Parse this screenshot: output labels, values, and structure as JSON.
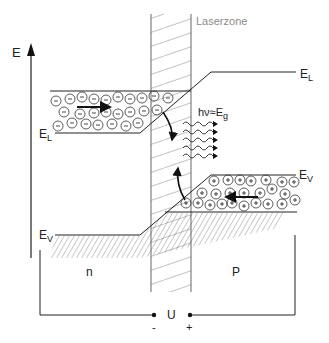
{
  "diagram": {
    "title": "",
    "axis_label": "E",
    "zone_label": "Laserzone",
    "conduction_band_label_left": {
      "main": "E",
      "sub": "L"
    },
    "conduction_band_label_right": {
      "main": "E",
      "sub": "L"
    },
    "valence_band_label_left": {
      "main": "E",
      "sub": "V"
    },
    "valence_band_label_right": {
      "main": "E",
      "sub": "V"
    },
    "photon_label": {
      "main": "hν≈E",
      "sub": "g"
    },
    "region_n_label": "n",
    "region_p_label": "P",
    "voltage_label": "U",
    "minus_terminal": "-",
    "plus_terminal": "+",
    "electron_symbol": "-",
    "hole_symbol": "+",
    "colors": {
      "line": "#222222",
      "hatch": "#9a9a9a",
      "zone_text": "#8a8a8a",
      "background": "#ffffff"
    }
  }
}
